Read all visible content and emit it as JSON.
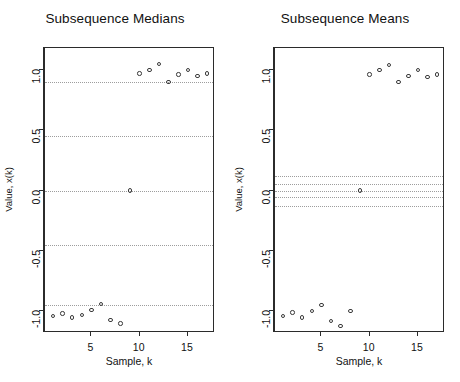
{
  "figure": {
    "background": "#ffffff",
    "foreground": "#1a1a1a",
    "gridline_color": "#9d9d9d",
    "marker_color": "#3a3a3a",
    "width": 460,
    "height": 382
  },
  "chart_data": [
    {
      "type": "scatter",
      "title": "Subsequence Medians",
      "xlabel": "Sample, k",
      "ylabel": "Value, x(k)",
      "xlim": [
        0.2,
        17.8
      ],
      "ylim": [
        -1.18,
        1.18
      ],
      "xticks": [
        5,
        10,
        15
      ],
      "xticklabels": [
        "5",
        "10",
        "15"
      ],
      "yticks": [
        1.0,
        0.5,
        0.0,
        -0.5,
        -1.0
      ],
      "yticklabels": [
        "1.0",
        "0.5",
        "0.0",
        "-0.5",
        "-1.0"
      ],
      "grid": true,
      "gridlines": [
        0.9,
        0.45,
        0.0,
        -0.45,
        -0.95
      ],
      "legend": null,
      "marker": "open-circle",
      "x": [
        1,
        2,
        3,
        4,
        5,
        6,
        7,
        8,
        9,
        10,
        11,
        12,
        13,
        14,
        15,
        16,
        17
      ],
      "y": [
        -1.04,
        -1.02,
        -1.05,
        -1.03,
        -0.99,
        -0.94,
        -1.07,
        -1.1,
        0.0,
        0.97,
        1.0,
        1.05,
        0.9,
        0.96,
        1.0,
        0.95,
        0.97
      ]
    },
    {
      "type": "scatter",
      "title": "Subsequence Means",
      "xlabel": "Sample, k",
      "ylabel": "Value, x(k)",
      "xlim": [
        0.2,
        17.8
      ],
      "ylim": [
        -1.18,
        1.18
      ],
      "xticks": [
        5,
        10,
        15
      ],
      "xticklabels": [
        "5",
        "10",
        "15"
      ],
      "yticks": [
        1.0,
        0.5,
        0.0,
        -0.5,
        -1.0
      ],
      "yticklabels": [
        "1.0",
        "0.5",
        "0.0",
        "-0.5",
        "-1.0"
      ],
      "grid": true,
      "gridlines": [
        0.12,
        0.05,
        0.0,
        -0.05,
        -0.13
      ],
      "legend": null,
      "marker": "open-circle",
      "x": [
        1,
        2,
        3,
        4,
        5,
        6,
        7,
        8,
        9,
        10,
        11,
        12,
        13,
        14,
        15,
        16,
        17
      ],
      "y": [
        -1.04,
        -1.01,
        -1.05,
        -1.0,
        -0.95,
        -1.08,
        -1.12,
        -1.0,
        0.0,
        0.96,
        1.0,
        1.04,
        0.9,
        0.95,
        1.0,
        0.94,
        0.96
      ]
    }
  ]
}
